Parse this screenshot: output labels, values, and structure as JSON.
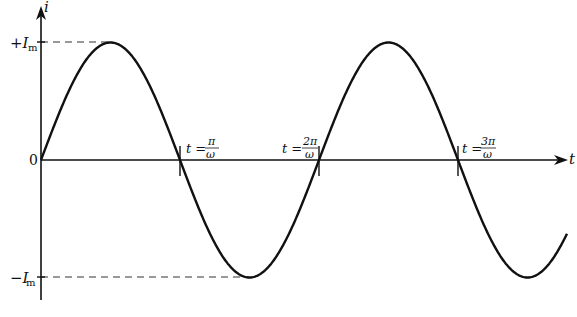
{
  "diagram": {
    "type": "sinusoid",
    "axes": {
      "y_label": "i",
      "x_label": "t",
      "origin_label": "0",
      "pos_peak_label": "+I",
      "neg_peak_label": "−I",
      "peak_subscript": "m"
    },
    "markers": [
      {
        "prefix": "t = ",
        "num": "π",
        "den": "ω"
      },
      {
        "prefix": "t = ",
        "num": "2π",
        "den": "ω"
      },
      {
        "prefix": "t = ",
        "num": "3π",
        "den": "ω"
      }
    ],
    "curve": {
      "function": "i = I_m sin(ωt)",
      "color": "#111111",
      "zero_crossings_px": [
        41,
        180,
        319,
        458
      ],
      "peak_px_y": 42,
      "trough_px_y": 277,
      "axis_px_y": 160
    }
  }
}
